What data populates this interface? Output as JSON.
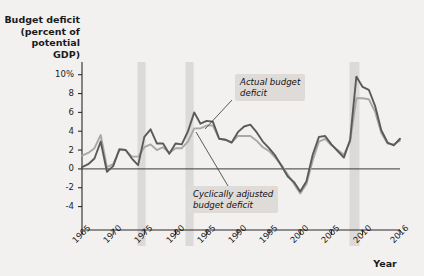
{
  "chart_data": {
    "type": "line",
    "title": "",
    "ylabel": "Budget deficit (percent of potential GDP)",
    "xlabel": "Year",
    "ylim": [
      -5,
      10.5
    ],
    "xlim": [
      1965,
      2016
    ],
    "grid": false,
    "legend_position": "inline-annotations",
    "ytick_labels": [
      "10%",
      "8",
      "6",
      "4",
      "2",
      "0",
      "-2",
      "-4"
    ],
    "ytick_values": [
      10,
      8,
      6,
      4,
      2,
      0,
      -2,
      -4
    ],
    "xtick_labels": [
      "1965",
      "1970",
      "1975",
      "1980",
      "1985",
      "1990",
      "1995",
      "2000",
      "2005",
      "2010",
      "2016"
    ],
    "xtick_values": [
      1965,
      1970,
      1975,
      1980,
      1985,
      1990,
      1995,
      2000,
      2005,
      2010,
      2016
    ],
    "zero_line": 0,
    "recession_bands": [
      {
        "start": 1973.9,
        "end": 1975.2
      },
      {
        "start": 1981.6,
        "end": 1982.9
      },
      {
        "start": 2007.9,
        "end": 2009.5
      }
    ],
    "series": [
      {
        "name": "Actual budget deficit",
        "color": "#5a5a5a",
        "x": [
          1965,
          1966,
          1967,
          1968,
          1969,
          1970,
          1971,
          1972,
          1973,
          1974,
          1975,
          1976,
          1977,
          1978,
          1979,
          1980,
          1981,
          1982,
          1983,
          1984,
          1985,
          1986,
          1987,
          1988,
          1989,
          1990,
          1991,
          1992,
          1993,
          1994,
          1995,
          1996,
          1997,
          1998,
          1999,
          2000,
          2001,
          2002,
          2003,
          2004,
          2005,
          2006,
          2007,
          2008,
          2009,
          2010,
          2011,
          2012,
          2013,
          2014,
          2015,
          2016
        ],
        "values": [
          0.2,
          0.5,
          1.1,
          2.9,
          -0.3,
          0.3,
          2.1,
          2.0,
          1.1,
          0.4,
          3.4,
          4.2,
          2.7,
          2.7,
          1.6,
          2.7,
          2.6,
          4.0,
          6.0,
          4.8,
          5.1,
          5.0,
          3.2,
          3.1,
          2.8,
          3.9,
          4.5,
          4.7,
          3.9,
          2.9,
          2.2,
          1.4,
          0.3,
          -0.8,
          -1.4,
          -2.4,
          -1.3,
          1.5,
          3.4,
          3.5,
          2.6,
          1.9,
          1.2,
          3.1,
          9.8,
          8.7,
          8.4,
          6.7,
          4.1,
          2.8,
          2.5,
          3.2
        ]
      },
      {
        "name": "Cyclically adjusted budget deficit",
        "color": "#a8a8a8",
        "x": [
          1965,
          1966,
          1967,
          1968,
          1969,
          1970,
          1971,
          1972,
          1973,
          1974,
          1975,
          1976,
          1977,
          1978,
          1979,
          1980,
          1981,
          1982,
          1983,
          1984,
          1985,
          1986,
          1987,
          1988,
          1989,
          1990,
          1991,
          1992,
          1993,
          1994,
          1995,
          1996,
          1997,
          1998,
          1999,
          2000,
          2001,
          2002,
          2003,
          2004,
          2005,
          2006,
          2007,
          2008,
          2009,
          2010,
          2011,
          2012,
          2013,
          2014,
          2015,
          2016
        ],
        "values": [
          1.4,
          1.7,
          2.2,
          3.6,
          0.2,
          0.5,
          2.0,
          2.0,
          1.3,
          1.3,
          2.3,
          2.6,
          2.0,
          2.3,
          1.7,
          2.2,
          2.2,
          2.9,
          4.3,
          4.3,
          4.6,
          4.6,
          3.2,
          3.1,
          2.8,
          3.5,
          3.5,
          3.5,
          3.0,
          2.3,
          1.9,
          1.2,
          0.4,
          -0.6,
          -1.6,
          -2.6,
          -1.6,
          0.9,
          2.9,
          3.2,
          2.5,
          2.0,
          1.5,
          2.9,
          7.5,
          7.5,
          7.4,
          6.1,
          3.8,
          2.7,
          2.6,
          3.0
        ]
      }
    ],
    "annotations": [
      {
        "name": "actual-budget-deficit",
        "text": "Actual budget\ndeficit",
        "leader_from": [
          232,
          100
        ],
        "leader_to": [
          205,
          129
        ]
      },
      {
        "name": "cyclically-adjusted-budget-deficit",
        "text": "Cyclically adjusted\nbudget deficit",
        "leader_from": [
          228,
          186
        ],
        "leader_to": [
          196,
          132
        ]
      }
    ]
  },
  "labels": {
    "y_axis_title": "Budget deficit\n(percent of\npotential\nGDP)",
    "x_axis_title": "Year"
  }
}
